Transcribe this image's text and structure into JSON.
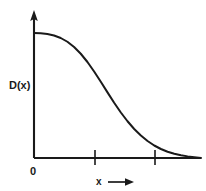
{
  "figure": {
    "background_color": "#ffffff",
    "line_color": "#1a1a1a",
    "ylabel": "D(x)",
    "xlabel": "x",
    "origin_label": "0",
    "xlabel_arrow": "→"
  },
  "chart_data": {
    "type": "line",
    "title": "",
    "subtitle": "",
    "xlabel": "x",
    "ylabel": "D(x)",
    "grid": false,
    "legend": null,
    "xlim": [
      0,
      1
    ],
    "ylim": [
      0,
      1
    ],
    "axis_style": {
      "y_axis_arrow": true,
      "x_axis_arrow": false,
      "x_tick_positions": [
        0.37,
        0.73
      ],
      "x_tick_labels": [
        "",
        ""
      ],
      "y_tick_positions": [],
      "y_tick_labels": []
    },
    "annotations": [
      {
        "text": "0",
        "x": 0.0,
        "y": 0.0,
        "placement": "below-origin"
      },
      {
        "text": "D(x)",
        "x": 0.0,
        "y": 0.5,
        "placement": "left-of-y-axis"
      },
      {
        "text": "x →",
        "x": 0.45,
        "y": 0.0,
        "placement": "below-x-axis"
      }
    ],
    "series": [
      {
        "name": "D(x)",
        "color": "#1a1a1a",
        "x": [
          0.0,
          0.04,
          0.08,
          0.12,
          0.16,
          0.2,
          0.24,
          0.28,
          0.32,
          0.36,
          0.4,
          0.44,
          0.48,
          0.52,
          0.56,
          0.6,
          0.64,
          0.68,
          0.72,
          0.76,
          0.8,
          0.84,
          0.88,
          0.92,
          0.96,
          1.0
        ],
        "y": [
          1.0,
          0.998,
          0.992,
          0.98,
          0.96,
          0.93,
          0.888,
          0.834,
          0.768,
          0.692,
          0.61,
          0.525,
          0.442,
          0.364,
          0.294,
          0.232,
          0.18,
          0.136,
          0.1,
          0.072,
          0.05,
          0.034,
          0.022,
          0.013,
          0.006,
          0.0
        ]
      }
    ]
  }
}
